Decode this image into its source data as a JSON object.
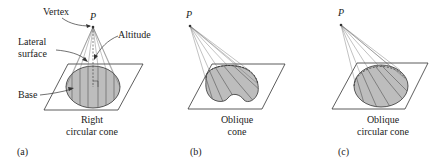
{
  "figure": {
    "panels": [
      {
        "id": "a",
        "panel_label": "(a)",
        "caption_line1": "Right",
        "caption_line2": "circular cone",
        "vertex_label": "P",
        "annotations": {
          "vertex": "Vertex",
          "altitude": "Altitude",
          "lateral_line1": "Lateral",
          "lateral_line2": "surface",
          "base": "Base"
        }
      },
      {
        "id": "b",
        "panel_label": "(b)",
        "caption_line1": "Oblique",
        "caption_line2": "cone",
        "vertex_label": "P"
      },
      {
        "id": "c",
        "panel_label": "(c)",
        "caption_line1": "Oblique",
        "caption_line2": "circular cone",
        "vertex_label": "P"
      }
    ],
    "colors": {
      "base_fill": "#bdbdbd",
      "line": "#333333",
      "ruling": "#555555"
    }
  }
}
